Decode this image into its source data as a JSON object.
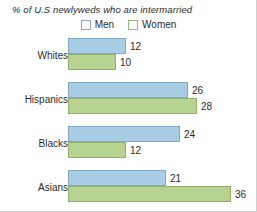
{
  "chart_data": {
    "type": "bar",
    "orientation": "horizontal",
    "title": "% of U.S newlyweds who are intermarried",
    "xlabel": "",
    "ylabel": "",
    "grid": false,
    "legend_position": "top-center",
    "categories": [
      "Whites",
      "Hispanics",
      "Blacks",
      "Asians"
    ],
    "series": [
      {
        "name": "Men",
        "color": "#a8cde5",
        "values": [
          12,
          26,
          24,
          21
        ]
      },
      {
        "name": "Women",
        "color": "#b7d392",
        "values": [
          10,
          28,
          12,
          36
        ]
      }
    ],
    "xlim": [
      0,
      36
    ],
    "value_labels": true
  },
  "legend": {
    "items": [
      {
        "label": "Men",
        "swatch": "men-swatch"
      },
      {
        "label": "Women",
        "swatch": "women-swatch"
      }
    ]
  },
  "groups": [
    {
      "label": "Whites",
      "men": {
        "value": "12",
        "width": 58
      },
      "women": {
        "value": "10",
        "width": 48
      }
    },
    {
      "label": "Hispanics",
      "men": {
        "value": "26",
        "width": 120
      },
      "women": {
        "value": "28",
        "width": 129
      }
    },
    {
      "label": "Blacks",
      "men": {
        "value": "24",
        "width": 112
      },
      "women": {
        "value": "12",
        "width": 58
      }
    },
    {
      "label": "Asians",
      "men": {
        "value": "21",
        "width": 98
      },
      "women": {
        "value": "36",
        "width": 163
      }
    }
  ]
}
